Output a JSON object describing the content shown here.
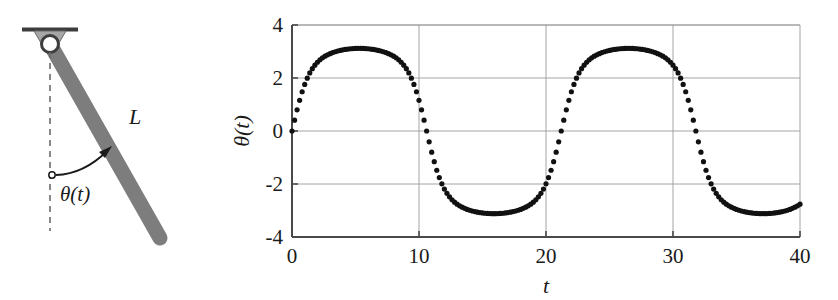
{
  "figure": {
    "width": 838,
    "height": 300,
    "background": "#ffffff"
  },
  "diagram": {
    "labels": {
      "length": "L",
      "angle": "θ(t)"
    },
    "colors": {
      "rod": "#7d7d7d",
      "ceiling": "#4a4a4a",
      "bracket": "#9a9a9a",
      "ink": "#1a1a1a",
      "hinge_fill": "#ffffff"
    },
    "geometry": {
      "pivot": [
        50,
        44
      ],
      "rod_end": [
        160,
        238
      ],
      "rod_width": 15,
      "ceiling_y": 29,
      "ceiling_x1": 22,
      "ceiling_x2": 78,
      "dashed_line_bottom": 230,
      "arc_origin": [
        52,
        175
      ],
      "rod_angle_deg_from_vertical": 29
    }
  },
  "chart_data": {
    "type": "scatter",
    "title": "",
    "xlabel": "t",
    "ylabel": "θ(t)",
    "xlim": [
      0,
      40
    ],
    "ylim": [
      -4,
      4
    ],
    "xticks": [
      0,
      10,
      20,
      30,
      40
    ],
    "xticklabels": [
      "0",
      "10",
      "20",
      "30",
      "40"
    ],
    "yticks": [
      -4,
      -2,
      0,
      2,
      4
    ],
    "yticklabels": [
      "-4",
      "-2",
      "0",
      "2",
      "4"
    ],
    "grid": true,
    "grid_color": "#9a9a9a",
    "axis_color": "#4a4a4a",
    "marker": "dot",
    "marker_color": "#111111",
    "marker_size": 2.6,
    "legend": null,
    "series": [
      {
        "name": "theta(t)",
        "description": "Nonlinear pendulum near-separatrix oscillation, amplitude about 3.1 rad, period about 21 time units",
        "amplitude": 3.12,
        "period": 21.2,
        "phase_deg": 0,
        "n_points": 201,
        "x": [
          0,
          0.2,
          0.4,
          0.6,
          0.8,
          1,
          1.2,
          1.4,
          1.6,
          1.8,
          2,
          2.2,
          2.4,
          2.6,
          2.8,
          3,
          3.2,
          3.4,
          3.6,
          3.8,
          4,
          4.2,
          4.4,
          4.6,
          4.8,
          5,
          5.2,
          5.4,
          5.6,
          5.8,
          6,
          6.2,
          6.4,
          6.6,
          6.8,
          7,
          7.2,
          7.4,
          7.6,
          7.8,
          8,
          8.2,
          8.4,
          8.6,
          8.8,
          9,
          9.2,
          9.4,
          9.6,
          9.8,
          10,
          10.2,
          10.4,
          10.6,
          10.8,
          11,
          11.2,
          11.4,
          11.6,
          11.8,
          12,
          12.2,
          12.4,
          12.6,
          12.8,
          13,
          13.2,
          13.4,
          13.6,
          13.8,
          14,
          14.2,
          14.4,
          14.6,
          14.8,
          15,
          15.2,
          15.4,
          15.6,
          15.8,
          16,
          16.2,
          16.4,
          16.6,
          16.8,
          17,
          17.2,
          17.4,
          17.6,
          17.8,
          18,
          18.2,
          18.4,
          18.6,
          18.8,
          19,
          19.2,
          19.4,
          19.6,
          19.8,
          20,
          20.2,
          20.4,
          20.6,
          20.8,
          21,
          21.2,
          21.4,
          21.6,
          21.8,
          22,
          22.2,
          22.4,
          22.6,
          22.8,
          23,
          23.2,
          23.4,
          23.6,
          23.8,
          24,
          24.2,
          24.4,
          24.6,
          24.8,
          25,
          25.2,
          25.4,
          25.6,
          25.8,
          26,
          26.2,
          26.4,
          26.6,
          26.8,
          27,
          27.2,
          27.4,
          27.6,
          27.8,
          28,
          28.2,
          28.4,
          28.6,
          28.8,
          29,
          29.2,
          29.4,
          29.6,
          29.8,
          30,
          30.2,
          30.4,
          30.6,
          30.8,
          31,
          31.2,
          31.4,
          31.6,
          31.8,
          32,
          32.2,
          32.4,
          32.6,
          32.8,
          33,
          33.2,
          33.4,
          33.6,
          33.8,
          34,
          34.2,
          34.4,
          34.6,
          34.8,
          35,
          35.2,
          35.4,
          35.6,
          35.8,
          36,
          36.2,
          36.4,
          36.6,
          36.8,
          37,
          37.2,
          37.4,
          37.6,
          37.8,
          38,
          38.2,
          38.4,
          38.6,
          38.8,
          39,
          39.2,
          39.4,
          39.6,
          39.8,
          40
        ]
      }
    ]
  },
  "plot_layout": {
    "axes_left_px": 72,
    "axes_right_px": 580,
    "axes_top_px": 25,
    "axes_bottom_px": 237,
    "panel_offset_x": 220
  }
}
